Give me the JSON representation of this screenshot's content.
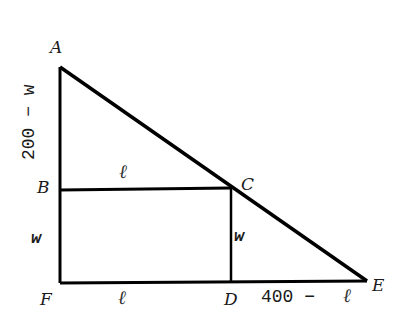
{
  "diagram": {
    "type": "geometry",
    "points": {
      "A": {
        "label": "A",
        "x": 60,
        "y": 67
      },
      "B": {
        "label": "B",
        "x": 60,
        "y": 190
      },
      "C": {
        "label": "C",
        "x": 231,
        "y": 188
      },
      "D": {
        "label": "D",
        "x": 231,
        "y": 283
      },
      "E": {
        "label": "E",
        "x": 367,
        "y": 280
      },
      "F": {
        "label": "F",
        "x": 60,
        "y": 283
      }
    },
    "segment_labels": {
      "AB": "200 − w",
      "BC": "ℓ",
      "BF": "w",
      "CD": "w",
      "FD": "ℓ",
      "DE_number": "400 −",
      "DE_var": "ℓ"
    },
    "colors": {
      "line": "#000000",
      "text": "#1a1a1a",
      "background": "#ffffff"
    }
  }
}
